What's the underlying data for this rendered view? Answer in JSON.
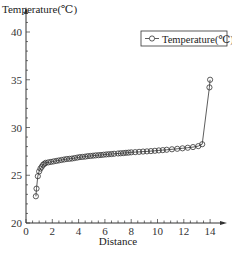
{
  "chart_data": {
    "type": "line",
    "title": "",
    "xlabel": "Distance",
    "ylabel": "Temperature(℃)",
    "xlim": [
      0,
      14.5
    ],
    "ylim": [
      20,
      41
    ],
    "xticks": [
      0,
      2,
      4,
      6,
      8,
      10,
      12,
      14
    ],
    "yticks": [
      20,
      25,
      30,
      35,
      40
    ],
    "grid": false,
    "legend_position": "upper right",
    "marker": "open-circle",
    "series": [
      {
        "name": "Temperature(℃)",
        "x": [
          0.75,
          0.8,
          0.9,
          1.0,
          1.1,
          1.2,
          1.3,
          1.4,
          1.5,
          1.7,
          1.9,
          2.1,
          2.3,
          2.5,
          2.7,
          2.9,
          3.1,
          3.3,
          3.5,
          3.7,
          3.9,
          4.1,
          4.3,
          4.5,
          4.7,
          4.9,
          5.1,
          5.3,
          5.5,
          5.7,
          5.9,
          6.1,
          6.3,
          6.5,
          6.7,
          7.0,
          7.2,
          7.4,
          7.6,
          7.8,
          8.0,
          8.3,
          8.6,
          8.9,
          9.2,
          9.5,
          9.8,
          10.1,
          10.4,
          10.7,
          11.1,
          11.5,
          11.9,
          12.3,
          12.7,
          13.1,
          13.4,
          13.95,
          14.0
        ],
        "y": [
          22.8,
          23.6,
          24.9,
          25.4,
          25.7,
          25.9,
          26.1,
          26.2,
          26.3,
          26.35,
          26.4,
          26.45,
          26.5,
          26.55,
          26.6,
          26.65,
          26.7,
          26.72,
          26.75,
          26.8,
          26.85,
          26.9,
          26.92,
          26.95,
          27.0,
          27.02,
          27.05,
          27.08,
          27.1,
          27.12,
          27.15,
          27.18,
          27.2,
          27.22,
          27.25,
          27.28,
          27.3,
          27.32,
          27.35,
          27.37,
          27.4,
          27.42,
          27.45,
          27.48,
          27.5,
          27.53,
          27.56,
          27.6,
          27.63,
          27.67,
          27.72,
          27.77,
          27.82,
          27.88,
          27.95,
          28.05,
          28.25,
          34.2,
          35.0
        ]
      }
    ]
  },
  "legend": {
    "label": "Temperature(℃)"
  },
  "axes": {
    "xlabel": "Distance",
    "ylabel": "Temperature(℃)"
  }
}
